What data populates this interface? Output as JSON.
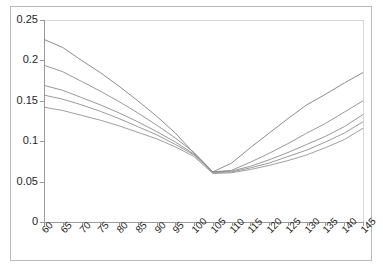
{
  "chart_data": {
    "type": "line",
    "title": "",
    "subtitle": "",
    "xlabel": "",
    "ylabel": "",
    "grid": false,
    "legend_position": "none",
    "xlim": [
      60,
      145
    ],
    "ylim": [
      0,
      0.25
    ],
    "y_ticks": [
      "0",
      "0.05",
      "0.1",
      "0.15",
      "0.2",
      "0.25"
    ],
    "y_tick_values": [
      0,
      0.05,
      0.1,
      0.15,
      0.2,
      0.25
    ],
    "x_tick_labels": [
      "60",
      "65",
      "70",
      "75",
      "80",
      "85",
      "90",
      "95",
      "100",
      "105",
      "110",
      "115",
      "120",
      "125",
      "130",
      "135",
      "140",
      "145"
    ],
    "x": [
      60,
      65,
      70,
      75,
      80,
      85,
      90,
      95,
      100,
      105,
      110,
      115,
      120,
      125,
      130,
      135,
      140,
      145
    ],
    "series": [
      {
        "name": "series-1",
        "color": "#7f7f7f",
        "values": [
          0.226,
          0.216,
          0.2,
          0.185,
          0.168,
          0.15,
          0.131,
          0.11,
          0.085,
          0.062,
          0.073,
          0.092,
          0.11,
          0.128,
          0.145,
          0.158,
          0.172,
          0.185
        ]
      },
      {
        "name": "series-2",
        "color": "#8c8c8c",
        "values": [
          0.194,
          0.186,
          0.174,
          0.162,
          0.149,
          0.135,
          0.12,
          0.104,
          0.086,
          0.062,
          0.064,
          0.074,
          0.085,
          0.097,
          0.11,
          0.122,
          0.136,
          0.15
        ]
      },
      {
        "name": "series-3",
        "color": "#8c8c8c",
        "values": [
          0.169,
          0.163,
          0.154,
          0.145,
          0.135,
          0.124,
          0.112,
          0.099,
          0.084,
          0.062,
          0.063,
          0.069,
          0.077,
          0.086,
          0.096,
          0.106,
          0.118,
          0.133
        ]
      },
      {
        "name": "series-4",
        "color": "#909090",
        "values": [
          0.157,
          0.152,
          0.145,
          0.137,
          0.128,
          0.118,
          0.108,
          0.096,
          0.083,
          0.061,
          0.062,
          0.067,
          0.073,
          0.081,
          0.089,
          0.099,
          0.11,
          0.124
        ]
      },
      {
        "name": "series-5",
        "color": "#949494",
        "values": [
          0.142,
          0.138,
          0.132,
          0.126,
          0.119,
          0.111,
          0.103,
          0.093,
          0.081,
          0.06,
          0.061,
          0.065,
          0.07,
          0.076,
          0.083,
          0.092,
          0.102,
          0.116
        ]
      }
    ]
  },
  "colors": {
    "axis": "#9a9a9a",
    "frame": "#b9b9b9",
    "text": "#262626",
    "background": "#ffffff"
  }
}
